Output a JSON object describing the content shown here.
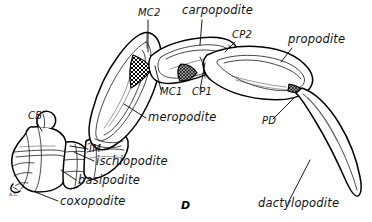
{
  "figure": {
    "plate_label": "D",
    "background_color": "#ffffff",
    "ink_color": "#000000"
  },
  "labels": {
    "segments": [
      {
        "id": "carpopodite",
        "text": "carpopodite",
        "x": 182,
        "y": 14,
        "anchor": "start",
        "style": "long"
      },
      {
        "id": "propodite",
        "text": "propodite",
        "x": 288,
        "y": 43,
        "anchor": "start",
        "style": "long"
      },
      {
        "id": "meropodite",
        "text": "meropodite",
        "x": 148,
        "y": 121,
        "anchor": "start",
        "style": "long"
      },
      {
        "id": "ischiopodite",
        "text": "ischiopodite",
        "x": 96,
        "y": 165,
        "anchor": "start",
        "style": "long"
      },
      {
        "id": "basipodite",
        "text": "basipodite",
        "x": 78,
        "y": 184,
        "anchor": "start",
        "style": "long"
      },
      {
        "id": "coxopodite",
        "text": "coxopodite",
        "x": 60,
        "y": 205,
        "anchor": "start",
        "style": "long"
      },
      {
        "id": "dactylopodite",
        "text": "dactylopodite",
        "x": 258,
        "y": 207,
        "anchor": "start",
        "style": "long"
      }
    ],
    "joints": [
      {
        "id": "mc2",
        "text": "MC2",
        "x": 138,
        "y": 16,
        "anchor": "start",
        "style": "abbr"
      },
      {
        "id": "cp2",
        "text": "CP2",
        "x": 232,
        "y": 38,
        "anchor": "start",
        "style": "abbr"
      },
      {
        "id": "mc1",
        "text": "MC1",
        "x": 160,
        "y": 95,
        "anchor": "start",
        "style": "abbr"
      },
      {
        "id": "cp1",
        "text": "CP1",
        "x": 192,
        "y": 95,
        "anchor": "start",
        "style": "abbr"
      },
      {
        "id": "pd",
        "text": "PD",
        "x": 262,
        "y": 124,
        "anchor": "start",
        "style": "abbr"
      },
      {
        "id": "cb",
        "text": "CB",
        "x": 28,
        "y": 119,
        "anchor": "start",
        "style": "abbr"
      },
      {
        "id": "im",
        "text": "IM",
        "x": 89,
        "y": 152,
        "anchor": "start",
        "style": "abbr"
      },
      {
        "id": "ac",
        "text": "A.C.",
        "x": 9,
        "y": 196,
        "anchor": "start",
        "style": "tiny"
      }
    ]
  }
}
